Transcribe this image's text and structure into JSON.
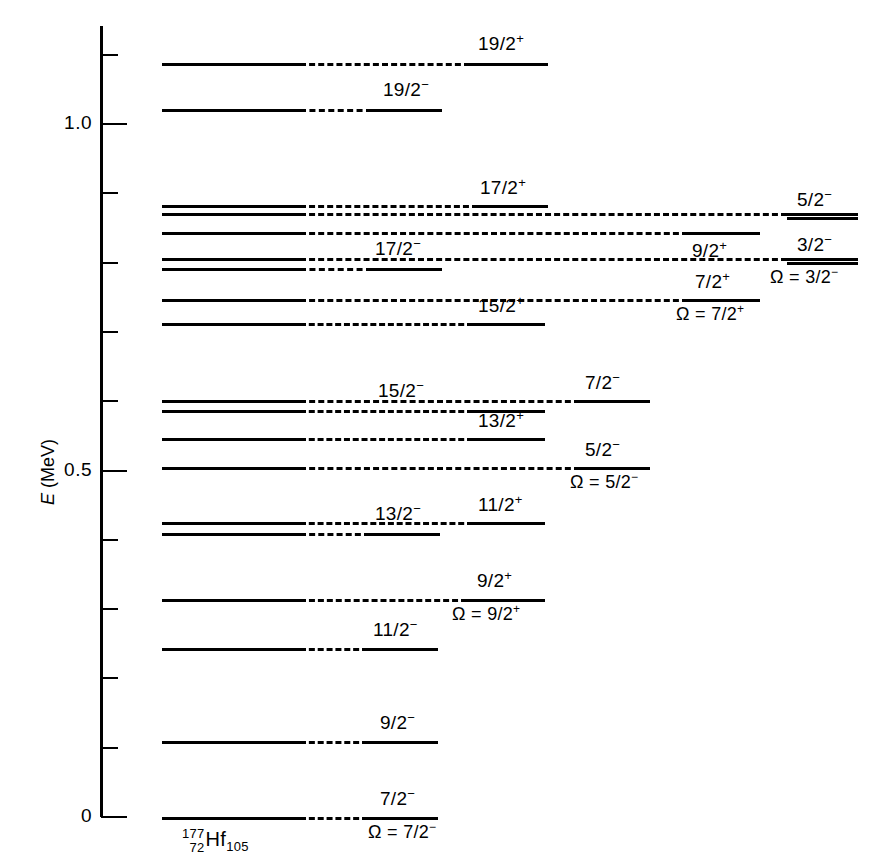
{
  "figure": {
    "isotope": {
      "mass": "177",
      "proton": "72",
      "symbol": "Hf",
      "neutron": "105"
    }
  },
  "axis": {
    "title_italic": "E",
    "title_unit": " (MeV)",
    "labels": [
      {
        "text": "1.0",
        "value": 1.0
      },
      {
        "text": "0.5",
        "value": 0.5
      },
      {
        "text": "0",
        "value": 0.0
      }
    ],
    "major_ticks": [
      0.0,
      0.5,
      1.0
    ],
    "minor_ticks": [
      0.1,
      0.2,
      0.3,
      0.4,
      0.6,
      0.7,
      0.8,
      0.9,
      1.1
    ]
  },
  "chart_data": {
    "type": "level-diagram",
    "xlabel": "",
    "ylabel": "E (MeV)",
    "ylim": [
      0.0,
      1.155
    ],
    "grid": false,
    "legend": "none",
    "bands": [
      {
        "name": "Omega = 7/2-",
        "omega_label": "Ω = 7/2",
        "omega_parity": "−",
        "column": 1
      },
      {
        "name": "Omega = 9/2+",
        "omega_label": "Ω = 9/2",
        "omega_parity": "+",
        "column": 2
      },
      {
        "name": "Omega = 5/2-",
        "omega_label": "Ω = 5/2",
        "omega_parity": "−",
        "column": 3
      },
      {
        "name": "Omega = 7/2+",
        "omega_label": "Ω = 7/2",
        "omega_parity": "+",
        "column": 3
      },
      {
        "name": "Omega = 3/2-",
        "omega_label": "Ω = 3/2",
        "omega_parity": "−",
        "column": 4
      }
    ],
    "levels": [
      {
        "spin": "19/2",
        "parity": "+",
        "energy": 1.087,
        "band": "Omega = 7/2-",
        "column": 1
      },
      {
        "spin": "19/2",
        "parity": "−",
        "energy": 1.02,
        "band": "Omega = 7/2-",
        "column": 1
      },
      {
        "spin": "17/2",
        "parity": "+",
        "energy": 0.882,
        "band": "Omega = 7/2-",
        "column": 1
      },
      {
        "spin": "17/2",
        "parity": "−",
        "energy": 0.79,
        "band": "Omega = 7/2-",
        "column": 1
      },
      {
        "spin": "15/2",
        "parity": "+",
        "energy": 0.711,
        "band": "Omega = 7/2-",
        "column": 1
      },
      {
        "spin": "15/2",
        "parity": "−",
        "energy": 0.6,
        "band": "Omega = 7/2-",
        "column": 1
      },
      {
        "spin": "13/2",
        "parity": "+",
        "energy": 0.545,
        "band": "Omega = 7/2-",
        "column": 1
      },
      {
        "spin": "13/2",
        "parity": "−",
        "energy": 0.408,
        "band": "Omega = 7/2-",
        "column": 1
      },
      {
        "spin": "11/2",
        "parity": "+",
        "energy": 0.424,
        "band": "Omega = 7/2-",
        "column": 1
      },
      {
        "spin": "11/2",
        "parity": "−",
        "energy": 0.241,
        "band": "Omega = 7/2-",
        "column": 1
      },
      {
        "spin": "9/2",
        "parity": "+",
        "energy": 0.312,
        "band": "Omega = 9/2+",
        "column": 2
      },
      {
        "spin": "9/2",
        "parity": "−",
        "energy": 0.107,
        "band": "Omega = 7/2-",
        "column": 1
      },
      {
        "spin": "7/2",
        "parity": "−",
        "energy": 0.0,
        "band": "Omega = 7/2-",
        "column": 1
      },
      {
        "spin": "7/2",
        "parity": "−",
        "energy": 0.6,
        "band": "Omega = 5/2-",
        "column": 3
      },
      {
        "spin": "5/2",
        "parity": "−",
        "energy": 0.503,
        "band": "Omega = 5/2-",
        "column": 3
      },
      {
        "spin": "9/2",
        "parity": "+",
        "energy": 0.843,
        "band": "Omega = 7/2+",
        "column": 3
      },
      {
        "spin": "7/2",
        "parity": "+",
        "energy": 0.741,
        "band": "Omega = 7/2+",
        "column": 3
      },
      {
        "spin": "5/2",
        "parity": "−",
        "energy": 0.864,
        "band": "Omega = 3/2-",
        "column": 4
      },
      {
        "spin": "3/2",
        "parity": "−",
        "energy": 0.799,
        "band": "Omega = 3/2-",
        "column": 4
      }
    ]
  },
  "levels_render": [
    {
      "key": "19/2+",
      "spin": "19/2",
      "parity": "+",
      "y": 63,
      "solid1": [
        162,
        300
      ],
      "dash": [
        300,
        470
      ],
      "solid2": [
        470,
        548
      ],
      "label_x": 478,
      "label_y": 33
    },
    {
      "key": "19/2-",
      "spin": "19/2",
      "parity": "−",
      "y": 109,
      "solid1": [
        162,
        300
      ],
      "dash": [
        300,
        372
      ],
      "solid2": [
        372,
        442
      ],
      "label_x": 383,
      "label_y": 79
    },
    {
      "key": "17/2+",
      "spin": "17/2",
      "parity": "+",
      "y": 205,
      "solid1": [
        162,
        300
      ],
      "dash": [
        300,
        478
      ],
      "solid2": [
        478,
        548
      ],
      "label_x": 480,
      "label_y": 177
    },
    {
      "key": "cluster-213",
      "spin": "",
      "parity": "",
      "y": 213,
      "solid1": [
        162,
        300
      ],
      "dash": [
        300,
        787
      ],
      "solid2": [
        787,
        858
      ],
      "label_x": 0,
      "label_y": 0
    },
    {
      "key": "9/2+band",
      "spin": "9/2",
      "parity": "+",
      "y": 232,
      "solid1": [
        162,
        300
      ],
      "dash": [
        300,
        688
      ],
      "solid2": [
        688,
        760
      ],
      "label_x": 692,
      "label_y": 240
    },
    {
      "key": "17/2-row",
      "spin": "",
      "parity": "",
      "y": 258,
      "solid1": [
        162,
        300
      ],
      "dash": [
        300,
        787
      ],
      "solid2": [
        787,
        858
      ],
      "label_x": 0,
      "label_y": 0
    },
    {
      "key": "17/2-",
      "spin": "17/2",
      "parity": "−",
      "y": 268,
      "solid1": [
        162,
        300
      ],
      "dash": [
        300,
        372
      ],
      "solid2": [
        372,
        442
      ],
      "label_x": 375,
      "label_y": 238
    },
    {
      "key": "7/2+band",
      "spin": "7/2",
      "parity": "+",
      "y": 299,
      "solid1": [
        162,
        300
      ],
      "dash": [
        300,
        688
      ],
      "solid2": [
        688,
        760
      ],
      "label_x": 695,
      "label_y": 271
    },
    {
      "key": "15/2+",
      "spin": "15/2",
      "parity": "+",
      "y": 323,
      "solid1": [
        162,
        300
      ],
      "dash": [
        300,
        473
      ],
      "solid2": [
        473,
        545
      ],
      "label_x": 478,
      "label_y": 295
    },
    {
      "key": "7/2-band",
      "spin": "7/2",
      "parity": "−",
      "y": 400,
      "solid1": [
        162,
        300
      ],
      "dash": [
        300,
        580
      ],
      "solid2": [
        580,
        650
      ],
      "label_x": 585,
      "label_y": 372
    },
    {
      "key": "15/2-",
      "spin": "15/2",
      "parity": "−",
      "y": 410,
      "solid1": [
        162,
        300
      ],
      "dash": [
        300,
        473
      ],
      "solid2": [
        473,
        545
      ],
      "label_x": 378,
      "label_y": 380
    },
    {
      "key": "13/2+",
      "spin": "13/2",
      "parity": "+",
      "y": 438,
      "solid1": [
        162,
        300
      ],
      "dash": [
        300,
        473
      ],
      "solid2": [
        473,
        545
      ],
      "label_x": 478,
      "label_y": 410
    },
    {
      "key": "5/2-band",
      "spin": "5/2",
      "parity": "−",
      "y": 467,
      "solid1": [
        162,
        300
      ],
      "dash": [
        300,
        580
      ],
      "solid2": [
        580,
        650
      ],
      "label_x": 585,
      "label_y": 439
    },
    {
      "key": "11/2+",
      "spin": "11/2",
      "parity": "+",
      "y": 522,
      "solid1": [
        162,
        300
      ],
      "dash": [
        300,
        473
      ],
      "solid2": [
        473,
        545
      ],
      "label_x": 478,
      "label_y": 494
    },
    {
      "key": "13/2-",
      "spin": "13/2",
      "parity": "−",
      "y": 533,
      "solid1": [
        162,
        300
      ],
      "dash": [
        300,
        370
      ],
      "solid2": [
        370,
        440
      ],
      "label_x": 375,
      "label_y": 503
    },
    {
      "key": "9/2+",
      "spin": "9/2",
      "parity": "+",
      "y": 599,
      "solid1": [
        162,
        300
      ],
      "dash": [
        300,
        467
      ],
      "solid2": [
        467,
        545
      ],
      "label_x": 477,
      "label_y": 570
    },
    {
      "key": "11/2-",
      "spin": "11/2",
      "parity": "−",
      "y": 648,
      "solid1": [
        162,
        300
      ],
      "dash": [
        300,
        368
      ],
      "solid2": [
        368,
        438
      ],
      "label_x": 373,
      "label_y": 619
    },
    {
      "key": "9/2-",
      "spin": "9/2",
      "parity": "−",
      "y": 741,
      "solid1": [
        162,
        300
      ],
      "dash": [
        300,
        368
      ],
      "solid2": [
        368,
        438
      ],
      "label_x": 380,
      "label_y": 712
    },
    {
      "key": "7/2-",
      "spin": "7/2",
      "parity": "−",
      "y": 817,
      "solid1": [
        162,
        300
      ],
      "dash": [
        300,
        368
      ],
      "solid2": [
        368,
        438
      ],
      "label_x": 380,
      "label_y": 788
    }
  ],
  "right_levels": [
    {
      "key": "5/2-_32band",
      "spin": "5/2",
      "parity": "−",
      "y": 217,
      "solid": [
        787,
        858
      ],
      "label_x": 797,
      "label_y": 189
    },
    {
      "key": "3/2-_32band",
      "spin": "3/2",
      "parity": "−",
      "y": 262,
      "solid": [
        787,
        858
      ],
      "label_x": 797,
      "label_y": 234
    }
  ],
  "omega_labels": [
    {
      "key": "omega-7-2-minus",
      "text": "Ω = 7/2",
      "parity": "−",
      "x": 368,
      "y": 822
    },
    {
      "key": "omega-9-2-plus",
      "text": "Ω = 9/2",
      "parity": "+",
      "x": 452,
      "y": 604
    },
    {
      "key": "omega-5-2-minus",
      "text": "Ω = 5/2",
      "parity": "−",
      "x": 570,
      "y": 472
    },
    {
      "key": "omega-7-2-plus",
      "text": "Ω = 7/2",
      "parity": "+",
      "x": 676,
      "y": 304
    },
    {
      "key": "omega-3-2-minus",
      "text": "Ω = 3/2",
      "parity": "−",
      "x": 770,
      "y": 267
    }
  ]
}
